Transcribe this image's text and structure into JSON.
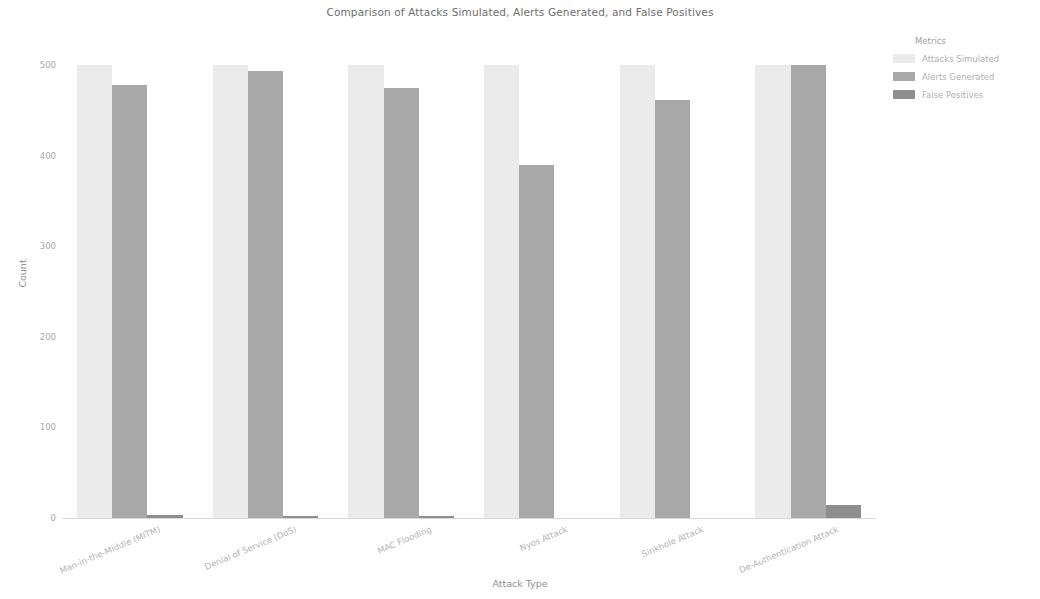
{
  "chart_data": {
    "type": "bar",
    "title": "Comparison of Attacks Simulated, Alerts Generated, and False Positives",
    "xlabel": "Attack Type",
    "ylabel": "Count",
    "ylim": [
      0,
      520
    ],
    "yticks": [
      0,
      100,
      200,
      300,
      400,
      500
    ],
    "ytick_labels": [
      "0",
      "100",
      "200",
      "300",
      "400",
      "500"
    ],
    "grid": false,
    "legend_title": "Metrics",
    "legend_position": "upper right outside",
    "categories": [
      "Man-in-the-Middle (MITM)",
      "Denial of Service (DoS)",
      "MAC Flooding",
      "Nyos Attack",
      "Sinkhole Attack",
      "De-Authentication Attack"
    ],
    "series": [
      {
        "name": "Attacks Simulated",
        "color": "#ebebeb",
        "values": [
          500,
          500,
          500,
          500,
          500,
          500
        ]
      },
      {
        "name": "Alerts Generated",
        "color": "#a8a8a8",
        "values": [
          478,
          493,
          475,
          390,
          462,
          500
        ]
      },
      {
        "name": "False Positives",
        "color": "#8e8e8e",
        "values": [
          3,
          2,
          2,
          0,
          0,
          14
        ]
      }
    ]
  }
}
